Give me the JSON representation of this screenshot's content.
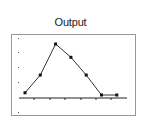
{
  "chart_data": {
    "type": "line",
    "title": "Output",
    "xlabel": "",
    "ylabel": "",
    "x": [
      1,
      2,
      3,
      4,
      5,
      6,
      7
    ],
    "series": [
      {
        "name": "Output",
        "values": [
          1,
          5,
          12,
          9,
          5,
          0.5,
          0.5
        ]
      }
    ],
    "ylim": [
      0,
      14
    ],
    "grid": false,
    "legend": "none",
    "markers": "square"
  },
  "colors": {
    "line": "#333333",
    "frame": "#999999",
    "axis": "#222222"
  }
}
